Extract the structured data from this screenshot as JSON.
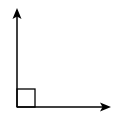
{
  "diagram": {
    "type": "right-angle",
    "stroke_color": "#000000",
    "background": "#ffffff",
    "vertex": [
      17,
      107
    ],
    "rays": [
      {
        "name": "vertical-ray",
        "from": [
          17,
          107
        ],
        "to": [
          17,
          8
        ],
        "arrowhead": true
      },
      {
        "name": "horizontal-ray",
        "from": [
          17,
          107
        ],
        "to": [
          111,
          107
        ],
        "arrowhead": true
      }
    ],
    "right_angle_marker": {
      "x": 17,
      "y": 89,
      "size": 18
    }
  }
}
